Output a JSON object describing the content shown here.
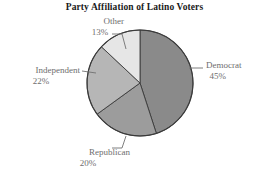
{
  "chart_data": {
    "type": "pie",
    "title": "Party Affiliation of Latino Voters",
    "xlabel": "",
    "ylabel": "",
    "legend": "none",
    "grid": false,
    "start_angle_deg": 90,
    "direction": "clockwise",
    "categories": [
      "Democrat",
      "Republican",
      "Independent",
      "Other"
    ],
    "values": [
      45,
      20,
      22,
      13
    ],
    "value_unit": "%",
    "slices": [
      {
        "label": "Democrat",
        "value": 45,
        "display": "45%",
        "color": "#8a8a8a"
      },
      {
        "label": "Republican",
        "value": 20,
        "display": "20%",
        "color": "#9c9c9c"
      },
      {
        "label": "Independent",
        "value": 22,
        "display": "22%",
        "color": "#b6b6b6"
      },
      {
        "label": "Other",
        "value": 13,
        "display": "13%",
        "color": "#e6e6e6"
      }
    ],
    "colors": {
      "democrat": "#8a8a8a",
      "republican": "#9c9c9c",
      "independent": "#b6b6b6",
      "other": "#e6e6e6",
      "outline": "#3a3a3a",
      "label_text": "#6e6e6e",
      "title_text": "#1a1a1a",
      "background": "#ffffff"
    }
  },
  "labels": {
    "democrat": {
      "name": "Democrat",
      "pct": "45%"
    },
    "republican": {
      "name": "Republican",
      "pct": "20%"
    },
    "independent": {
      "name": "Independent",
      "pct": "22%"
    },
    "other": {
      "name": "Other",
      "pct": "13%"
    }
  }
}
